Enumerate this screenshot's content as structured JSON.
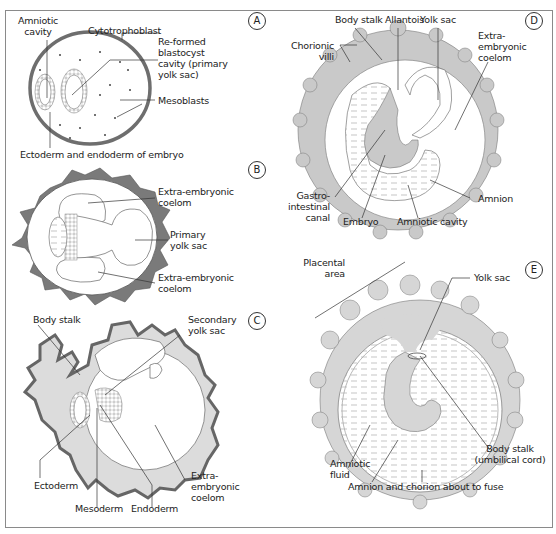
{
  "figure": {
    "colors": {
      "tissue_fill": "#c9c9c9",
      "trophoblast_fill": "#7a7a7a",
      "outline": "#555555",
      "border": "#8a8a8a",
      "text": "#222222",
      "background": "#ffffff"
    }
  },
  "panels": {
    "A": {
      "badge": "A",
      "labels": {
        "amniotic_cavity": "Amniotic\ncavity",
        "cytotrophoblast": "Cytotrophoblast",
        "blastocyst_cavity": "Re-formed\nblastocyst\ncavity (primary\nyolk sac)",
        "mesoblasts": "Mesoblasts",
        "ectoderm_endoderm": "Ectoderm and endoderm of embryo"
      }
    },
    "B": {
      "badge": "B",
      "labels": {
        "coelom_top": "Extra-embryonic\ncoelom",
        "primary_yolk_sac": "Primary\nyolk sac",
        "coelom_bottom": "Extra-embryonic\ncoelom"
      }
    },
    "C": {
      "badge": "C",
      "labels": {
        "body_stalk": "Body stalk",
        "secondary_yolk_sac": "Secondary\nyolk sac",
        "ectoderm": "Ectoderm",
        "mesoderm": "Mesoderm",
        "endoderm": "Endoderm",
        "coelom": "Extra-\nembryonic\ncoelom"
      }
    },
    "D": {
      "badge": "D",
      "labels": {
        "body_stalk": "Body stalk",
        "allantois": "Allantois",
        "yolk_sac": "Yolk sac",
        "chorionic_villi": "Chorionic\nvilli",
        "coelom": "Extra-\nembryonic\ncoelom",
        "gastro_intestinal": "Gastro-\nintestinal\ncanal",
        "embryo": "Embryo",
        "amniotic_cavity": "Amniotic cavity",
        "amnion": "Amnion"
      }
    },
    "E": {
      "badge": "E",
      "labels": {
        "placental_area": "Placental\narea",
        "yolk_sac": "Yolk sac",
        "body_stalk": "Body stalk\n(umbilical cord)",
        "amniotic_fluid": "Amniotic\nfluid",
        "amnion_chorion": "Amnion and chorion about to fuse"
      }
    }
  }
}
